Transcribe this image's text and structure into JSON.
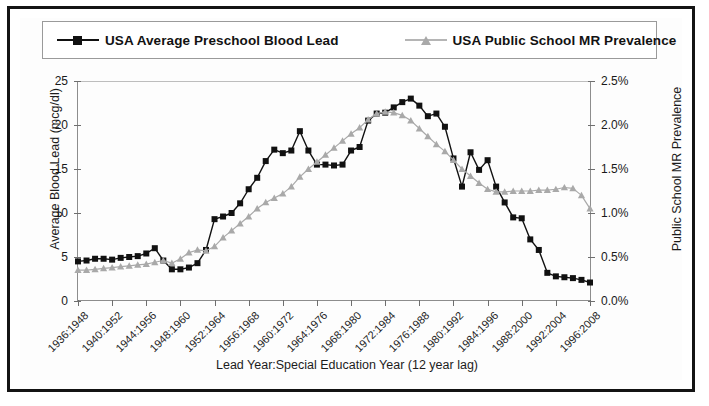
{
  "legend": {
    "entries": [
      {
        "label": "USA Average Preschool Blood Lead",
        "marker": "square-marker",
        "color": "#111111"
      },
      {
        "label": "USA Public School MR Prevalence",
        "marker": "triangle-marker",
        "color": "#a9a9a9"
      }
    ]
  },
  "axes": {
    "left_title": "Average Blood Lead (mcg/dl)",
    "right_title": "Public School MR Prevalence",
    "x_title": "Lead Year:Special Education Year (12 year lag)",
    "left_ticks": [
      "0",
      "5",
      "10",
      "15",
      "20",
      "25"
    ],
    "right_ticks": [
      "0.0%",
      "0.5%",
      "1.0%",
      "1.5%",
      "2.0%",
      "2.5%"
    ]
  },
  "chart_data": {
    "type": "line",
    "title": "",
    "subtitle": "",
    "xlabel": "Lead Year:Special Education Year (12 year lag)",
    "ylabel": "Average Blood Lead (mcg/dl)",
    "y2label": "Public School MR Prevalence",
    "ylim": [
      0,
      25
    ],
    "y2lim": [
      0,
      2.5
    ],
    "grid": false,
    "legend_position": "top",
    "x_tick_labels": [
      "1936:1948",
      "1940:1952",
      "1944:1956",
      "1948:1960",
      "1952:1964",
      "1956:1968",
      "1960:1972",
      "1964:1976",
      "1968:1980",
      "1972:1984",
      "1976:1988",
      "1980:1992",
      "1984:1996",
      "1988:2000",
      "1992:2004",
      "1996:2008"
    ],
    "x_tick_indices": [
      0,
      4,
      8,
      12,
      16,
      20,
      24,
      28,
      32,
      36,
      40,
      44,
      48,
      52,
      56,
      60
    ],
    "x": [
      1936,
      1937,
      1938,
      1939,
      1940,
      1941,
      1942,
      1943,
      1944,
      1945,
      1946,
      1947,
      1948,
      1949,
      1950,
      1951,
      1952,
      1953,
      1954,
      1955,
      1956,
      1957,
      1958,
      1959,
      1960,
      1961,
      1962,
      1963,
      1964,
      1965,
      1966,
      1967,
      1968,
      1969,
      1970,
      1971,
      1972,
      1973,
      1974,
      1975,
      1976,
      1977,
      1978,
      1979,
      1980,
      1981,
      1982,
      1983,
      1984,
      1985,
      1986,
      1987,
      1988,
      1989,
      1990,
      1991,
      1992,
      1993,
      1994,
      1995,
      1996
    ],
    "series": [
      {
        "name": "USA Average Preschool Blood Lead",
        "axis": "left",
        "units": "mcg/dl",
        "marker": "square",
        "color": "#111111",
        "values": [
          4.5,
          4.6,
          4.8,
          4.8,
          4.7,
          4.9,
          5.0,
          5.1,
          5.4,
          6.0,
          4.6,
          3.6,
          3.6,
          3.8,
          4.3,
          5.8,
          9.3,
          9.6,
          10.0,
          11.1,
          12.7,
          14.0,
          15.9,
          17.2,
          16.8,
          17.1,
          19.3,
          17.1,
          15.5,
          15.5,
          15.4,
          15.5,
          17.1,
          17.5,
          20.5,
          21.3,
          21.4,
          22.0,
          22.6,
          23.0,
          22.2,
          21.0,
          21.3,
          19.8,
          16.2,
          13.0,
          16.9,
          14.9,
          16.0,
          13.0,
          11.2,
          9.5,
          9.4,
          7.0,
          5.8,
          3.2,
          2.8,
          2.7,
          2.6,
          2.4,
          2.1
        ]
      },
      {
        "name": "USA Public School MR Prevalence",
        "axis": "right",
        "units": "%",
        "marker": "triangle",
        "color": "#a9a9a9",
        "values": [
          0.35,
          0.35,
          0.36,
          0.37,
          0.38,
          0.39,
          0.4,
          0.41,
          0.42,
          0.44,
          0.46,
          0.43,
          0.48,
          0.55,
          0.58,
          0.57,
          0.62,
          0.72,
          0.8,
          0.88,
          0.96,
          1.05,
          1.12,
          1.17,
          1.22,
          1.3,
          1.41,
          1.5,
          1.58,
          1.66,
          1.74,
          1.82,
          1.9,
          1.97,
          2.06,
          2.13,
          2.15,
          2.14,
          2.11,
          2.05,
          1.96,
          1.87,
          1.78,
          1.7,
          1.6,
          1.5,
          1.42,
          1.34,
          1.27,
          1.24,
          1.24,
          1.25,
          1.25,
          1.25,
          1.26,
          1.26,
          1.27,
          1.29,
          1.28,
          1.2,
          1.05
        ]
      }
    ]
  }
}
